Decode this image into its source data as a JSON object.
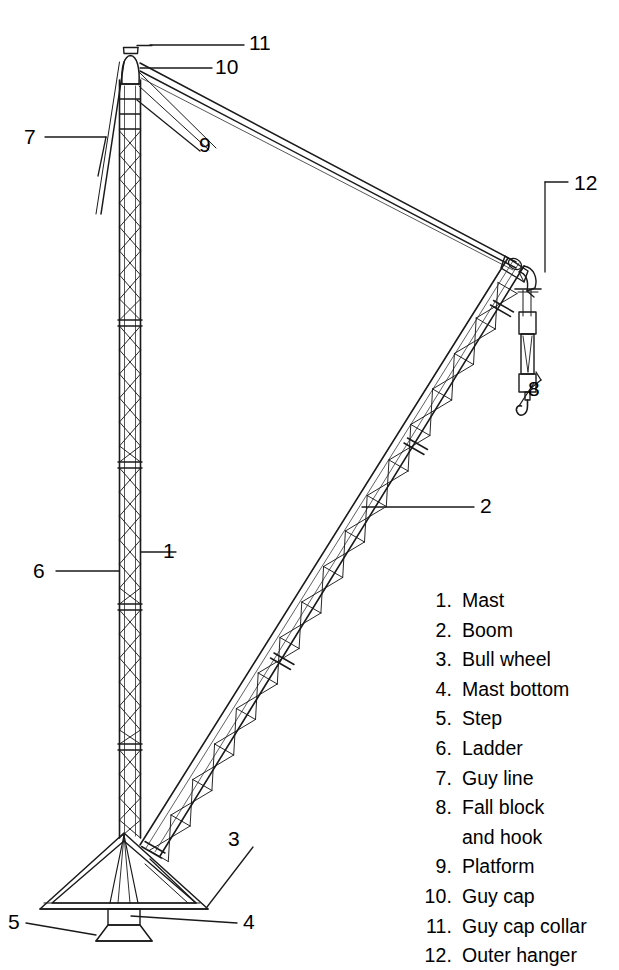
{
  "figure": {
    "line_color": "#1a1a1a",
    "background_color": "#ffffff"
  },
  "legend": {
    "items": [
      {
        "number": "1.",
        "label": "Mast"
      },
      {
        "number": "2.",
        "label": "Boom"
      },
      {
        "number": "3.",
        "label": "Bull wheel"
      },
      {
        "number": "4.",
        "label": "Mast bottom"
      },
      {
        "number": "5.",
        "label": "Step"
      },
      {
        "number": "6.",
        "label": "Ladder"
      },
      {
        "number": "7.",
        "label": "Guy line"
      },
      {
        "number": "8.",
        "label": "Fall block",
        "label_line2": "and hook"
      },
      {
        "number": "9.",
        "label": "Platform"
      },
      {
        "number": "10.",
        "label": "Guy cap"
      },
      {
        "number": "11.",
        "label": "Guy cap collar"
      },
      {
        "number": "12.",
        "label": "Outer hanger"
      }
    ]
  },
  "callouts": [
    {
      "id": "callout-1",
      "number": "1",
      "x": 163,
      "y": 562,
      "target": "mast"
    },
    {
      "id": "callout-2",
      "number": "2",
      "x": 480,
      "y": 497,
      "target": "boom"
    },
    {
      "id": "callout-3",
      "number": "3",
      "x": 228,
      "y": 835,
      "target": "bull-wheel"
    },
    {
      "id": "callout-4",
      "number": "4",
      "x": 243,
      "y": 917,
      "target": "mast-bottom"
    },
    {
      "id": "callout-5",
      "number": "5",
      "x": 8,
      "y": 917,
      "target": "step"
    },
    {
      "id": "callout-6",
      "number": "6",
      "x": 41,
      "y": 571,
      "target": "ladder"
    },
    {
      "id": "callout-7",
      "number": "7",
      "x": 29,
      "y": 133,
      "target": "guy-line"
    },
    {
      "id": "callout-8",
      "number": "8",
      "x": 528,
      "y": 386,
      "target": "fall-block-and-hook"
    },
    {
      "id": "callout-9",
      "number": "9",
      "x": 199,
      "y": 143,
      "target": "platform"
    },
    {
      "id": "callout-10",
      "number": "10",
      "x": 213,
      "y": 62,
      "target": "guy-cap"
    },
    {
      "id": "callout-11",
      "number": "11",
      "x": 247,
      "y": 38,
      "target": "guy-cap-collar"
    },
    {
      "id": "callout-12",
      "number": "12",
      "x": 573,
      "y": 177,
      "target": "outer-hanger"
    }
  ]
}
